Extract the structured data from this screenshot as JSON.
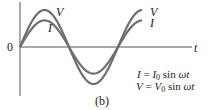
{
  "figure": {
    "caption": "(b)",
    "origin_label": "0",
    "t_axis_label": "t",
    "curve_labels": {
      "V_peak": "V",
      "I_peak": "I",
      "V_end": "V",
      "I_end": "I"
    },
    "equations": [
      {
        "lhs": "I",
        "eq": " = ",
        "amp": "I",
        "amp_sub": "0",
        "rest": " sin ",
        "arg": "ωt"
      },
      {
        "lhs": "V",
        "eq": " = ",
        "amp": "V",
        "amp_sub": "0",
        "rest": " sin ",
        "arg": "ωt"
      }
    ],
    "colors": {
      "curve": "#6e6e6e",
      "axis": "#555555",
      "text": "#222222"
    }
  },
  "chart_data": {
    "type": "line",
    "title": "",
    "xlabel": "t",
    "ylabel": "",
    "series": [
      {
        "name": "V",
        "formula": "V = V0 sin ωt",
        "amplitude": 1.0,
        "phase": 0
      },
      {
        "name": "I",
        "formula": "I = I0 sin ωt",
        "amplitude": 0.72,
        "phase": 0
      }
    ],
    "x_range_periods": [
      0,
      1.25
    ],
    "annotations": [
      "0",
      "t",
      "V",
      "I",
      "(b)"
    ],
    "note": "Current and voltage in phase (resistive circuit)"
  }
}
